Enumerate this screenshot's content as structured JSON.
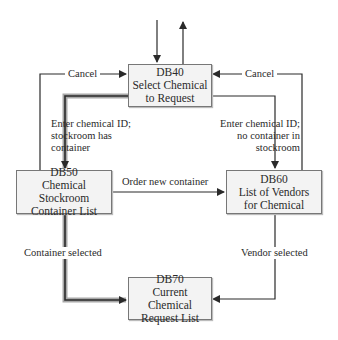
{
  "nodes": {
    "db40": {
      "id": "DB40",
      "line1": "Select Chemical",
      "line2": "to Request"
    },
    "db50": {
      "id": "DB50",
      "line1": "Chemical Stockroom",
      "line2": "Container List"
    },
    "db60": {
      "id": "DB60",
      "line1": "List of Vendors",
      "line2": "for Chemical"
    },
    "db70": {
      "id": "DB70",
      "line1": "Current Chemical",
      "line2": "Request List"
    }
  },
  "edges": {
    "cancel_left": "Cancel",
    "cancel_right": "Cancel",
    "to_db50": {
      "line1": "Enter chemical ID;",
      "line2": "stockroom has",
      "line3": "container"
    },
    "to_db60": {
      "line1": "Enter chemical ID;",
      "line2": "no container in",
      "line3": "stockroom"
    },
    "order_new": "Order new container",
    "container_selected": "Container selected",
    "vendor_selected": "Vendor selected"
  },
  "colors": {
    "line": "#2a2a2a",
    "highlight_path": "#9a9a9a",
    "box_fill": "#f3f3f3"
  }
}
